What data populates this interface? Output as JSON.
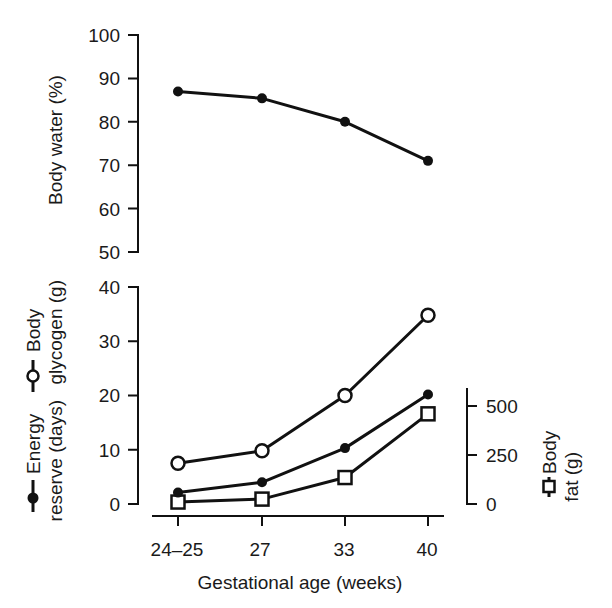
{
  "chart_data": [
    {
      "type": "line",
      "panel": "top",
      "title": "",
      "xlabel": "",
      "ylabel": "Body water (%)",
      "ylim": [
        50,
        100
      ],
      "yticks": [
        100,
        90,
        80,
        70,
        60,
        50
      ],
      "categories": [
        "24–25",
        "27",
        "33",
        "40"
      ],
      "grid": false,
      "series": [
        {
          "name": "Body water (%)",
          "marker": "filled-circle",
          "values": [
            87,
            85.4,
            80,
            71
          ]
        }
      ]
    },
    {
      "type": "line",
      "panel": "bottom",
      "title": "",
      "xlabel": "Gestational age (weeks)",
      "ylabel_left": [
        "Energy reserve (days)",
        "Body glycogen (g)"
      ],
      "ylabel_right": "Body fat (g)",
      "ylim_left": [
        0,
        40
      ],
      "yticks_left": [
        40,
        30,
        20,
        10,
        0
      ],
      "ylim_right": [
        0,
        600
      ],
      "yticks_right": [
        500,
        250,
        0
      ],
      "categories": [
        "24–25",
        "27",
        "33",
        "40"
      ],
      "grid": false,
      "series": [
        {
          "name": "Body glycogen (g)",
          "axis": "left",
          "marker": "open-circle",
          "values": [
            7.5,
            9.8,
            20,
            34.8
          ]
        },
        {
          "name": "Energy reserve (days)",
          "axis": "left",
          "marker": "filled-circle",
          "values": [
            2.1,
            4.0,
            10.3,
            20.2
          ]
        },
        {
          "name": "Body fat (g)",
          "axis": "right",
          "marker": "open-square",
          "values": [
            10,
            25,
            135,
            460
          ]
        }
      ]
    }
  ],
  "labels": {
    "top_ylabel": "Body water (%)",
    "top_ticks": [
      "100",
      "90",
      "80",
      "70",
      "60",
      "50"
    ],
    "bottom_left_ticks": [
      "40",
      "30",
      "20",
      "10",
      "0"
    ],
    "bottom_right_ticks": [
      "500",
      "250",
      "0"
    ],
    "x_ticks": [
      "24–25",
      "27",
      "33",
      "40"
    ],
    "xlabel": "Gestational age (weeks)",
    "legend_glycogen_line1": "Body",
    "legend_glycogen_line2": "glycogen (g)",
    "legend_energy_line1": "Energy",
    "legend_energy_line2": "reserve (days)",
    "legend_fat_line1": "Body",
    "legend_fat_line2": "fat (g)"
  }
}
